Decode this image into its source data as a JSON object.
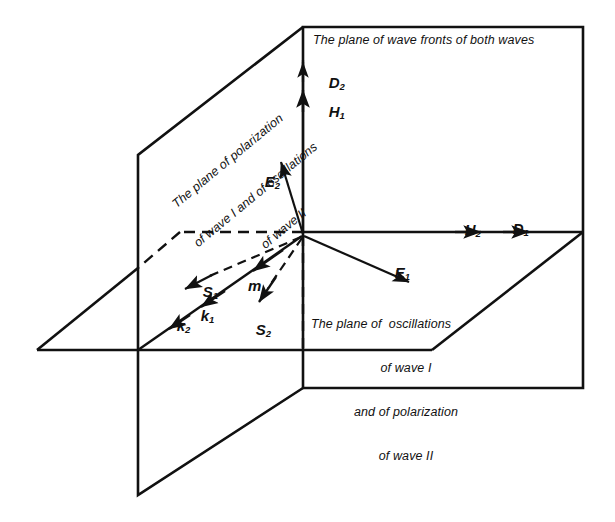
{
  "figure": {
    "background": "#ffffff",
    "ink": "#111111",
    "width": 615,
    "height": 522
  },
  "captions": {
    "wave_front_plane": "The plane of wave fronts of both waves",
    "polarization_plane": {
      "line1": "The plane of polarization",
      "line2": "of wave I and of oscillations",
      "line3": "of wave II"
    },
    "oscillation_plane": {
      "line1": "The plane of  oscillations",
      "line2": "of wave I",
      "line3": "and of polarization",
      "line4": "of wave II"
    }
  },
  "vectors": [
    {
      "id": "D2",
      "symbol": "D",
      "subscript": "2",
      "direction": "up",
      "style": "solid"
    },
    {
      "id": "H1",
      "symbol": "H",
      "subscript": "1",
      "direction": "up",
      "style": "solid"
    },
    {
      "id": "H2",
      "symbol": "H",
      "subscript": "2",
      "direction": "right",
      "style": "solid"
    },
    {
      "id": "D1",
      "symbol": "D",
      "subscript": "1",
      "direction": "right",
      "style": "solid"
    },
    {
      "id": "E1",
      "symbol": "E",
      "subscript": "1",
      "direction": "down-right",
      "style": "solid"
    },
    {
      "id": "E2",
      "symbol": "E",
      "subscript": "2",
      "direction": "up-left",
      "style": "solid"
    },
    {
      "id": "S1",
      "symbol": "S",
      "subscript": "1",
      "direction": "down-left",
      "style": "dashed"
    },
    {
      "id": "S2",
      "symbol": "S",
      "subscript": "2",
      "direction": "down-left",
      "style": "dashed"
    },
    {
      "id": "k1",
      "symbol": "k",
      "subscript": "1",
      "direction": "down-left",
      "style": "solid"
    },
    {
      "id": "k2",
      "symbol": "k",
      "subscript": "2",
      "direction": "down-left",
      "style": "solid"
    },
    {
      "id": "m",
      "symbol": "m",
      "subscript": "",
      "direction": "down-left",
      "style": "solid"
    }
  ]
}
